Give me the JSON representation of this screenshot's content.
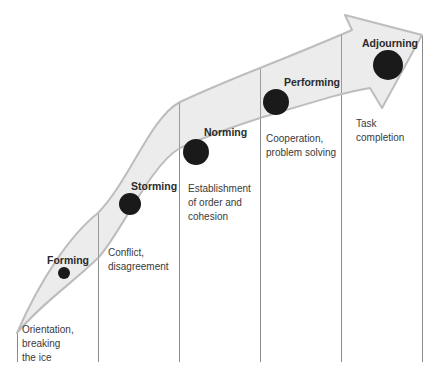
{
  "diagram": {
    "type": "stage-progression-arrow",
    "colors": {
      "arrow_fill": "#ececec",
      "arrow_stroke": "#bdbdbd",
      "dot": "#1a1a1a",
      "divider": "#8a8a8a",
      "label": "#2a2a2a",
      "desc": "#3a3a3a"
    },
    "stages": [
      {
        "name": "Forming",
        "description_lines": [
          "Orientation,",
          "breaking",
          "the ice"
        ]
      },
      {
        "name": "Storming",
        "description_lines": [
          "Conflict,",
          "disagreement"
        ]
      },
      {
        "name": "Norming",
        "description_lines": [
          "Establishment",
          "of order and",
          "cohesion"
        ]
      },
      {
        "name": "Performing",
        "description_lines": [
          "Cooperation,",
          "problem solving"
        ]
      },
      {
        "name": "Adjourning",
        "description_lines": [
          "Task",
          "completion"
        ]
      }
    ]
  }
}
